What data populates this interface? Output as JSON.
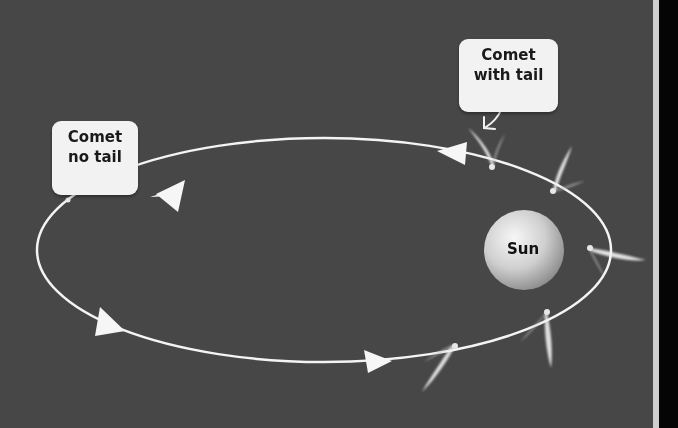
{
  "diagram": {
    "colors": {
      "background": "#474747",
      "orbit": "#f4f4f4",
      "label_bg": "#f2f2f2",
      "label_text": "#1a1a1a",
      "sun_light": "#f5f5f5",
      "sun_dark": "#8c8c8c"
    },
    "labels": {
      "comet_no_tail": {
        "line1": "Comet",
        "line2": "no tail"
      },
      "comet_with_tail": {
        "line1": "Comet",
        "line2": "with tail"
      },
      "sun": "Sun"
    },
    "orbit": {
      "shape": "ellipse",
      "direction": "counter-clockwise",
      "center": [
        324,
        250
      ],
      "radii": [
        287,
        112
      ]
    },
    "comets": [
      {
        "position": [
          68,
          200
        ],
        "tail": false
      },
      {
        "position": [
          492,
          167
        ],
        "tail": true
      },
      {
        "position": [
          553,
          191
        ],
        "tail": true
      },
      {
        "position": [
          590,
          248
        ],
        "tail": true
      },
      {
        "position": [
          547,
          312
        ],
        "tail": true
      },
      {
        "position": [
          455,
          346
        ],
        "tail": true
      }
    ]
  }
}
